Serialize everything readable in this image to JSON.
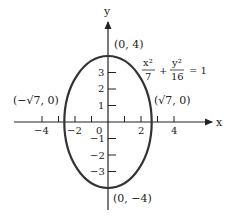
{
  "axes": {
    "x_label": "x",
    "y_label": "y",
    "x_ticks": [
      {
        "value": -4,
        "label": "−4"
      },
      {
        "value": -3,
        "label": ""
      },
      {
        "value": -2,
        "label": "−2"
      },
      {
        "value": -1,
        "label": ""
      },
      {
        "value": 0,
        "label": "0"
      },
      {
        "value": 1,
        "label": ""
      },
      {
        "value": 2,
        "label": "2"
      },
      {
        "value": 3,
        "label": ""
      },
      {
        "value": 4,
        "label": "4"
      }
    ],
    "y_ticks": [
      {
        "value": 3,
        "label": "3"
      },
      {
        "value": 2,
        "label": "2"
      },
      {
        "value": 1,
        "label": "1"
      },
      {
        "value": -1,
        "label": "−1"
      },
      {
        "value": -2,
        "label": "−2"
      },
      {
        "value": -3,
        "label": "−3"
      }
    ]
  },
  "ellipse": {
    "a_squared": 7,
    "b_squared": 16,
    "stroke_color": "#333333"
  },
  "points": {
    "top": "(0, 4)",
    "bottom": "(0, −4)",
    "left": "(−√7, 0)",
    "right": "(√7, 0)"
  },
  "equation": {
    "term1_num": "x²",
    "term1_den": "7",
    "plus": "+",
    "term2_num": "y²",
    "term2_den": "16",
    "rhs": "= 1"
  }
}
